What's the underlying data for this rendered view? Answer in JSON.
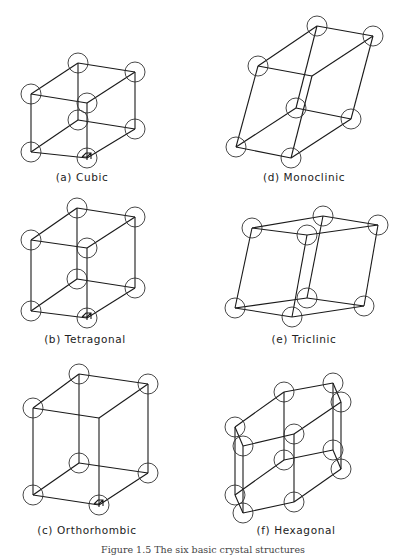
{
  "figure": {
    "caption": "Figure 1.5  The six basic crystal structures",
    "atom_radius": 10,
    "panels": [
      {
        "id": "cubic",
        "label": "(a) Cubic",
        "label_pos": [
          82,
          181
        ],
        "nodes": [
          [
            78,
            63
          ],
          [
            135,
            72
          ],
          [
            31,
            94
          ],
          [
            87,
            103
          ],
          [
            78,
            120
          ],
          [
            135,
            129
          ],
          [
            31,
            152
          ],
          [
            87,
            158
          ]
        ],
        "atoms": [
          0,
          1,
          2,
          3,
          4,
          5,
          6,
          7
        ],
        "edges": [
          [
            0,
            1
          ],
          [
            0,
            2
          ],
          [
            1,
            3
          ],
          [
            2,
            3
          ],
          [
            4,
            5
          ],
          [
            4,
            6
          ],
          [
            5,
            7
          ],
          [
            6,
            7
          ],
          [
            0,
            4
          ],
          [
            1,
            5
          ],
          [
            2,
            6
          ],
          [
            3,
            7
          ]
        ],
        "origin_mark": [
          87,
          158
        ]
      },
      {
        "id": "tetragonal",
        "label": "(b) Tetragonal",
        "label_pos": [
          85,
          343
        ],
        "nodes": [
          [
            77,
            208
          ],
          [
            135,
            217
          ],
          [
            31,
            240
          ],
          [
            87,
            248
          ],
          [
            77,
            279
          ],
          [
            135,
            288
          ],
          [
            31,
            311
          ],
          [
            87,
            318
          ]
        ],
        "atoms": [
          0,
          1,
          2,
          3,
          4,
          5,
          6,
          7
        ],
        "edges": [
          [
            0,
            1
          ],
          [
            0,
            2
          ],
          [
            1,
            3
          ],
          [
            2,
            3
          ],
          [
            4,
            5
          ],
          [
            4,
            6
          ],
          [
            5,
            7
          ],
          [
            6,
            7
          ],
          [
            0,
            4
          ],
          [
            1,
            5
          ],
          [
            2,
            6
          ],
          [
            3,
            7
          ]
        ],
        "origin_mark": [
          87,
          318
        ]
      },
      {
        "id": "orthorhombic",
        "label": "(c) Orthorhombic",
        "label_pos": [
          87,
          534
        ],
        "nodes": [
          [
            79,
            374
          ],
          [
            148,
            384
          ],
          [
            33,
            408
          ],
          [
            99,
            418
          ],
          [
            79,
            463
          ],
          [
            148,
            473
          ],
          [
            33,
            495
          ],
          [
            99,
            505
          ]
        ],
        "atoms": [
          0,
          1,
          2,
          4,
          5,
          6,
          7
        ],
        "edges": [
          [
            0,
            1
          ],
          [
            0,
            2
          ],
          [
            1,
            3
          ],
          [
            2,
            3
          ],
          [
            4,
            5
          ],
          [
            4,
            6
          ],
          [
            5,
            7
          ],
          [
            6,
            7
          ],
          [
            0,
            4
          ],
          [
            1,
            5
          ],
          [
            2,
            6
          ],
          [
            3,
            7
          ]
        ],
        "origin_mark": [
          99,
          505
        ]
      },
      {
        "id": "monoclinic",
        "label": "(d) Monoclinic",
        "label_pos": [
          304,
          181
        ],
        "nodes": [
          [
            317,
            26
          ],
          [
            373,
            36
          ],
          [
            258,
            66
          ],
          [
            312,
            76
          ],
          [
            296,
            108
          ],
          [
            351,
            119
          ],
          [
            236,
            147
          ],
          [
            291,
            158
          ]
        ],
        "atoms": [
          0,
          1,
          2,
          4,
          5,
          6,
          7
        ],
        "edges": [
          [
            0,
            1
          ],
          [
            0,
            2
          ],
          [
            1,
            3
          ],
          [
            2,
            3
          ],
          [
            4,
            5
          ],
          [
            4,
            6
          ],
          [
            5,
            7
          ],
          [
            6,
            7
          ],
          [
            0,
            4
          ],
          [
            1,
            5
          ],
          [
            2,
            6
          ],
          [
            3,
            7
          ]
        ],
        "origin_mark": null
      },
      {
        "id": "triclinic",
        "label": "(e) Triclinic",
        "label_pos": [
          304,
          343
        ],
        "nodes": [
          [
            323,
            216
          ],
          [
            378,
            225
          ],
          [
            252,
            228
          ],
          [
            307,
            235
          ],
          [
            307,
            298
          ],
          [
            364,
            306
          ],
          [
            235,
            308
          ],
          [
            292,
            317
          ]
        ],
        "atoms": [
          0,
          1,
          2,
          3,
          4,
          5,
          6,
          7
        ],
        "edges": [
          [
            0,
            1
          ],
          [
            0,
            2
          ],
          [
            1,
            3
          ],
          [
            2,
            3
          ],
          [
            4,
            5
          ],
          [
            4,
            6
          ],
          [
            5,
            7
          ],
          [
            6,
            7
          ],
          [
            0,
            4
          ],
          [
            1,
            5
          ],
          [
            2,
            6
          ],
          [
            3,
            7
          ]
        ],
        "origin_mark": null
      },
      {
        "id": "hexagonal",
        "label": "(f) Hexagonal",
        "label_pos": [
          296,
          534
        ],
        "nodes": [
          [
            235,
            427
          ],
          [
            284,
            392
          ],
          [
            333,
            383
          ],
          [
            341,
            402
          ],
          [
            294,
            434
          ],
          [
            243,
            446
          ],
          [
            235,
            495
          ],
          [
            284,
            460
          ],
          [
            333,
            450
          ],
          [
            341,
            469
          ],
          [
            294,
            502
          ],
          [
            243,
            513
          ]
        ],
        "atoms": [
          0,
          1,
          2,
          3,
          4,
          5,
          6,
          7,
          8,
          9,
          10,
          11
        ],
        "edges": [
          [
            0,
            1
          ],
          [
            1,
            2
          ],
          [
            2,
            3
          ],
          [
            3,
            4
          ],
          [
            4,
            5
          ],
          [
            5,
            0
          ],
          [
            6,
            7
          ],
          [
            7,
            8
          ],
          [
            8,
            9
          ],
          [
            9,
            10
          ],
          [
            10,
            11
          ],
          [
            11,
            6
          ],
          [
            0,
            6
          ],
          [
            1,
            7
          ],
          [
            2,
            8
          ],
          [
            3,
            9
          ],
          [
            4,
            10
          ],
          [
            5,
            11
          ]
        ],
        "origin_mark": null
      }
    ]
  }
}
